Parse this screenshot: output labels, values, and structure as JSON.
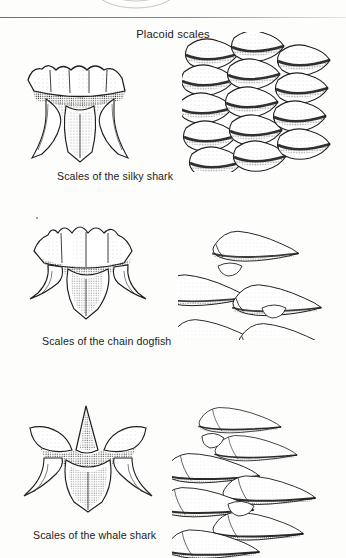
{
  "page": {
    "background_color": "#fdfdfc",
    "ink_color": "#1b1b1b",
    "width": 346,
    "height": 558
  },
  "divider": {
    "name": "horizontal-rule",
    "color": "#6f6f6f"
  },
  "figure": {
    "title": "Placoid scales",
    "rows": [
      {
        "caption": "Scales of the silky shark",
        "single_scale": {
          "shape": "crown-with-ridges-on-stalked-base",
          "cusps": 4
        },
        "cluster": {
          "arrangement": "overlapping-columns",
          "columns": 2,
          "scale_count": 11
        }
      },
      {
        "caption": "Scales of the chain dogfish",
        "single_scale": {
          "shape": "star-shaped-with-pointed-cusps",
          "cusps": 5
        },
        "cluster": {
          "arrangement": "overlapping-rows-pointing-right",
          "rows": 3,
          "scale_count": 6
        }
      },
      {
        "caption": "Scales of the whale shark",
        "single_scale": {
          "shape": "star-shaped-with-tall-central-spine",
          "cusps": 5
        },
        "cluster": {
          "arrangement": "overlapping-rows-pointing-right",
          "rows": 4,
          "scale_count": 8
        }
      }
    ]
  },
  "top_remnant": {
    "description": "cut-off illustration from preceding figure"
  }
}
